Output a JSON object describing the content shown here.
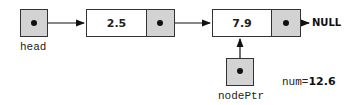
{
  "diagram": {
    "type": "linked-list",
    "head": {
      "label": "head"
    },
    "nodes": [
      {
        "value": "2.5"
      },
      {
        "value": "7.9"
      }
    ],
    "terminator": "NULL",
    "node_ptr": {
      "label": "nodePtr",
      "points_to_node_index": 1
    },
    "num": {
      "prefix": "num=",
      "value": "12.6"
    },
    "colors": {
      "pointer_fill": "#d3d3d3",
      "border": "#333333",
      "data_fill": "#ffffff"
    }
  }
}
